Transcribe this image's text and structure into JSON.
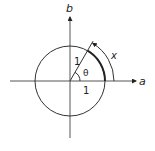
{
  "diagram": {
    "axes": {
      "horizontal_label": "a",
      "vertical_label": "b"
    },
    "labels": {
      "radius_label": "1",
      "angle_label": "θ",
      "base_label": "1",
      "arc_label": "x"
    },
    "angle_degrees": 60,
    "circle_radius_units": 1,
    "colors": {
      "stroke": "#222222",
      "background": "#ffffff"
    }
  }
}
